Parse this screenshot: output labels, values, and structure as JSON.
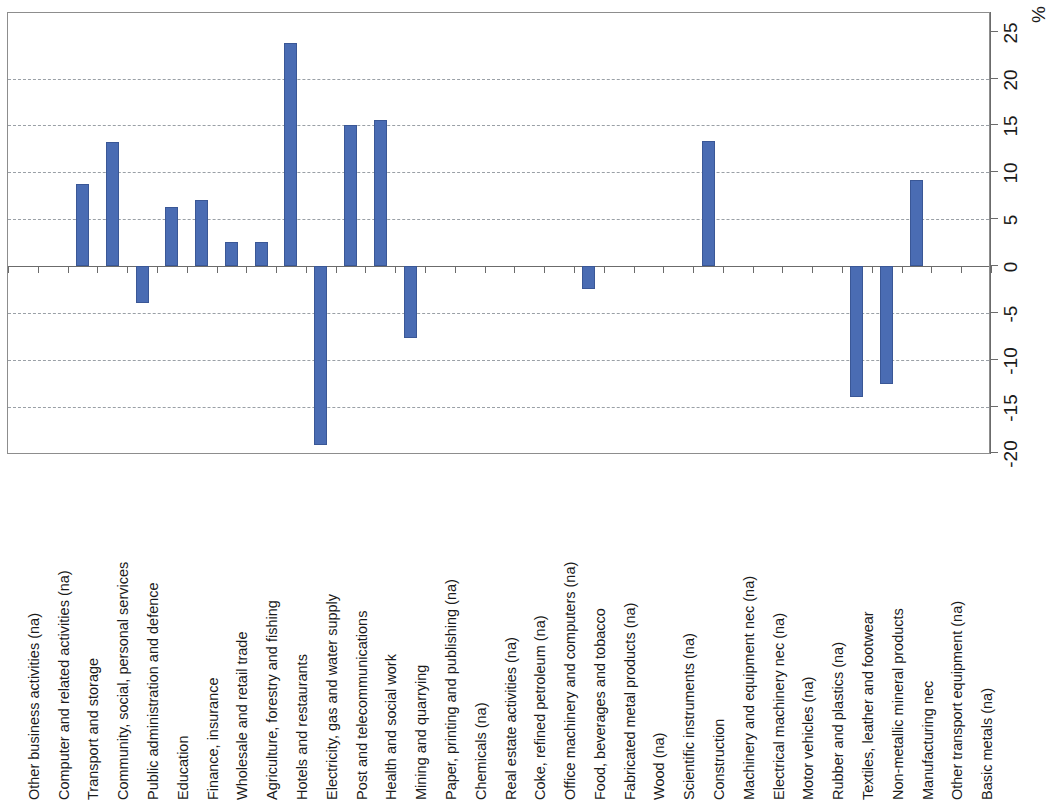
{
  "chart_data": {
    "type": "bar",
    "title": "",
    "xlabel": "",
    "ylabel": "%",
    "ylim": [
      -20,
      25
    ],
    "yticks": [
      -20,
      -15,
      -10,
      -5,
      0,
      5,
      10,
      15,
      20,
      25
    ],
    "ytick_labels": [
      "-20",
      "-15",
      "-10",
      "-5",
      "0",
      "5",
      "10",
      "15",
      "20",
      "25"
    ],
    "grid": true,
    "gridlines_at": [
      -15,
      -10,
      -5,
      5,
      10,
      15,
      20
    ],
    "legend": null,
    "orientation": "vertical",
    "bar_color": "#4a6cb3",
    "categories": [
      "Other business activities  (na)",
      "Computer and related activities (na)",
      "Transport and storage",
      "Community, social, personal services",
      "Public administration and defence",
      "Education",
      "Finance, insurance",
      "Wholesale and retail trade",
      "Agriculture, forestry and fishing",
      "Hotels and restaurants",
      "Electricity, gas and water supply",
      "Post and telecommunications",
      "Health and social work",
      "Mining and quarrying",
      "Paper, printing and publishing (na)",
      "Chemicals (na)",
      "Real estate activities (na)",
      "Coke, refined petroleum (na)",
      "Office machinery and computers (na)",
      "Food, beverages and tobacco",
      "Fabricated metal products (na)",
      "Wood (na)",
      "Scientific instruments (na)",
      "Construction",
      "Machinery and equipment nec  (na)",
      "Electrical machinery nec (na)",
      "Motor vehicles (na)",
      "Rubber and plastics (na)",
      "Textiles, leather and footwear",
      "Non-metallic mineral products",
      "Manufacturing nec",
      "Other transport equipment (na)",
      "Basic metals (na)"
    ],
    "values": [
      null,
      null,
      8.8,
      13.2,
      -3.9,
      6.3,
      7.0,
      2.6,
      2.6,
      23.8,
      -19.1,
      15.0,
      15.6,
      -7.7,
      null,
      null,
      null,
      null,
      null,
      -2.5,
      null,
      null,
      null,
      13.3,
      null,
      null,
      null,
      null,
      -14.0,
      -12.6,
      9.2,
      null,
      null
    ]
  },
  "axis": {
    "percent_symbol": "%"
  }
}
